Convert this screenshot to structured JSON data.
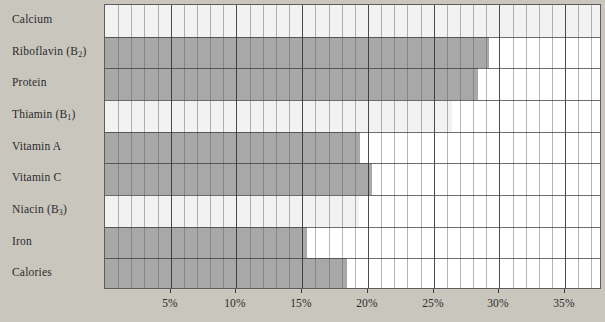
{
  "chart_data": {
    "type": "bar",
    "orientation": "horizontal",
    "title": "",
    "subtitle": "",
    "xlabel": "",
    "ylabel": "",
    "xlim": [
      0,
      37.8
    ],
    "ylim": null,
    "grid": true,
    "legend": null,
    "tick_format": "percent",
    "xticks": [
      5,
      10,
      15,
      20,
      25,
      30,
      35
    ],
    "xtick_labels": [
      "5%",
      "10%",
      "15%",
      "20%",
      "25%",
      "30%",
      "35%"
    ],
    "minor_tick_step": 1,
    "categories": [
      "Calcium",
      "Riboflavin (B2)",
      "Protein",
      "Thiamin (B1)",
      "Vitamin A",
      "Vitamin C",
      "Niacin (B3)",
      "Iron",
      "Calories"
    ],
    "values": [
      37.8,
      29.2,
      28.4,
      26.4,
      19.4,
      20.3,
      19.3,
      15.4,
      18.4
    ],
    "bar_shades": [
      "light",
      "dark",
      "dark",
      "light",
      "dark",
      "dark",
      "light",
      "dark",
      "dark"
    ],
    "colors": {
      "dark_bar": "#a8a8a8",
      "light_bar": "#f2f2f2",
      "plot_background": "#ffffff",
      "figure_background": "#c9c6be",
      "grid_minor": "#5a5a5a",
      "grid_major": "#2d2d2d",
      "axis_border": "#5d5d5d",
      "text": "#2b2b2b"
    }
  },
  "labels": [
    {
      "base": "Calcium",
      "sub": ""
    },
    {
      "base": "Riboflavin (B",
      "sub": "2",
      "tail": ")"
    },
    {
      "base": "Protein",
      "sub": ""
    },
    {
      "base": "Thiamin (B",
      "sub": "1",
      "tail": ")"
    },
    {
      "base": "Vitamin A",
      "sub": ""
    },
    {
      "base": "Vitamin C",
      "sub": ""
    },
    {
      "base": "Niacin (B",
      "sub": "3",
      "tail": ")"
    },
    {
      "base": "Iron",
      "sub": ""
    },
    {
      "base": "Calories",
      "sub": ""
    }
  ]
}
